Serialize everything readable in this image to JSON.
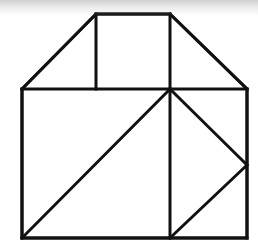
{
  "figure": {
    "background_color": "#ffffff",
    "stroke_color": "#111111",
    "stroke_width": 3,
    "canvas": {
      "width": 258,
      "height": 252
    },
    "artifact": {
      "name": "scan-shadow",
      "edge": "top",
      "height": 16,
      "color": "#969696"
    },
    "vertices": {
      "roof_peak_left": [
        96,
        14
      ],
      "roof_peak_right": [
        170,
        14
      ],
      "eave_left": [
        22,
        89
      ],
      "eave_right": [
        247,
        89
      ],
      "wall_bottom_left": [
        22,
        238
      ],
      "wall_bottom_right": [
        247,
        238
      ],
      "center_junction": [
        170,
        89
      ],
      "inner_rect_left_base": [
        96,
        89
      ],
      "mid_vertical_bottom": [
        170,
        238
      ],
      "right_triangle_apex": [
        247,
        165
      ]
    },
    "segments": [
      {
        "name": "roof-ridge",
        "from": [
          96,
          14
        ],
        "to": [
          170,
          14
        ]
      },
      {
        "name": "roof-slope-left",
        "from": [
          96,
          14
        ],
        "to": [
          22,
          89
        ]
      },
      {
        "name": "roof-slope-right",
        "from": [
          170,
          14
        ],
        "to": [
          247,
          89
        ]
      },
      {
        "name": "eave-line",
        "from": [
          22,
          89
        ],
        "to": [
          247,
          89
        ]
      },
      {
        "name": "wall-left",
        "from": [
          22,
          89
        ],
        "to": [
          22,
          238
        ]
      },
      {
        "name": "wall-right",
        "from": [
          247,
          89
        ],
        "to": [
          247,
          238
        ]
      },
      {
        "name": "wall-bottom",
        "from": [
          22,
          238
        ],
        "to": [
          247,
          238
        ]
      },
      {
        "name": "inner-rect-left-edge",
        "from": [
          96,
          14
        ],
        "to": [
          96,
          89
        ]
      },
      {
        "name": "inner-rect-right-edge",
        "from": [
          170,
          14
        ],
        "to": [
          170,
          89
        ]
      },
      {
        "name": "main-diagonal",
        "from": [
          22,
          238
        ],
        "to": [
          170,
          89
        ]
      },
      {
        "name": "mid-vertical",
        "from": [
          170,
          89
        ],
        "to": [
          170,
          238
        ]
      },
      {
        "name": "right-triangle-upper-edge",
        "from": [
          170,
          89
        ],
        "to": [
          247,
          165
        ]
      },
      {
        "name": "right-triangle-lower-edge",
        "from": [
          247,
          165
        ],
        "to": [
          170,
          238
        ]
      }
    ]
  }
}
